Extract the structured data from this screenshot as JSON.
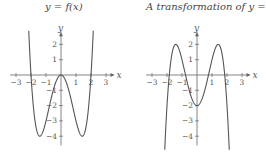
{
  "left": {
    "title": "y = f(x)",
    "x_label": "x",
    "y_label": "y",
    "x_ticks": [
      "−3",
      "−2",
      "−1",
      "1",
      "2",
      "3"
    ],
    "y_ticks": [
      "2",
      "1",
      "−1",
      "−2",
      "−3",
      "−4"
    ]
  },
  "right": {
    "title": "A transformation of y = f(x)",
    "x_label": "x",
    "y_label": "y",
    "x_ticks": [
      "−3",
      "−2",
      "−1",
      "1",
      "2",
      "3"
    ],
    "y_ticks": [
      "2",
      "1",
      "−1",
      "−2",
      "−3",
      "−4"
    ]
  },
  "chart_data": [
    {
      "type": "line",
      "title": "y = f(x)",
      "xlabel": "x",
      "ylabel": "y",
      "xlim": [
        -3.3,
        3.3
      ],
      "ylim": [
        -4.5,
        2.6
      ],
      "x": [
        -2.1,
        -2,
        -1.5,
        -1.41,
        -1,
        -0.5,
        0,
        0.5,
        1,
        1.41,
        1.5,
        2,
        2.1
      ],
      "y": [
        2.9,
        0,
        -3.9,
        -4,
        -3,
        -0.9,
        0,
        -0.9,
        -3,
        -4,
        -3.9,
        0,
        2.9
      ],
      "description": "Quartic f(x)=x^4-4x^2 with zeros at -2,0,2 and minima -4 at x=±1.41"
    },
    {
      "type": "line",
      "title": "A transformation of y = f(x)",
      "xlabel": "x",
      "ylabel": "y",
      "xlim": [
        -3.3,
        3.3
      ],
      "ylim": [
        -4.5,
        2.6
      ],
      "x": [
        -2.1,
        -2,
        -1.41,
        -1,
        -0.5,
        0,
        0.5,
        1,
        1.41,
        2,
        2.1
      ],
      "y": [
        -4.9,
        -2,
        2,
        1,
        -1.1,
        -2,
        -1.1,
        1,
        2,
        -2,
        -4.9
      ],
      "description": "g(x) = -f(x) - 2, maxima 2 at x=±1.41, minimum -2 at x=0"
    }
  ]
}
